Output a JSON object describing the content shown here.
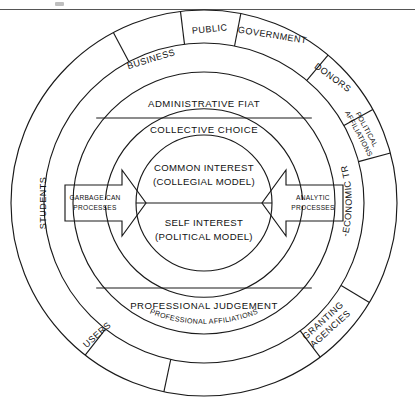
{
  "figure": {
    "background_color": "#ffffff",
    "line_color": "#1a1a1a",
    "top_rule": true
  },
  "geometry": {
    "center_x": 204,
    "center_y": 203,
    "r_outer": 193,
    "r_outer_inner": 160,
    "r_band": 131,
    "r_core": 68
  },
  "outer_ring": {
    "name": "stakeholder-ring",
    "segments": [
      {
        "id": "students",
        "label": "STUDENTS",
        "orientation": "radial"
      },
      {
        "id": "business",
        "label": "BUSINESS",
        "orientation": "radial"
      },
      {
        "id": "public",
        "label": "PUBLIC",
        "orientation": "radial"
      },
      {
        "id": "government",
        "label": "GOVERNMENT",
        "orientation": "radial"
      },
      {
        "id": "donors",
        "label": "DONORS",
        "orientation": "radial"
      },
      {
        "id": "political-affiliations",
        "label": "POLITICAL AFFILIATIONS",
        "label_line1": "POLITICAL",
        "label_line2": "AFFILIATIONS",
        "orientation": "radial"
      },
      {
        "id": "socio-economic-trends",
        "label": "SOCIO-ECONOMIC TRENDS",
        "orientation": "curved"
      },
      {
        "id": "granting-agencies",
        "label": "GRANTING AGENCIES",
        "label_line1": "GRANTING",
        "label_line2": "AGENCIES",
        "orientation": "radial"
      },
      {
        "id": "professional-affiliations",
        "label": "PROFESSIONAL AFFILIATIONS",
        "orientation": "curved"
      },
      {
        "id": "users",
        "label": "USERS",
        "orientation": "radial"
      }
    ]
  },
  "bands": {
    "top": {
      "id": "administrative-fiat",
      "label": "ADMINISTRATIVE FIAT"
    },
    "upper_mid": {
      "id": "collective-choice",
      "label": "COLLECTIVE CHOICE"
    },
    "bottom": {
      "id": "professional-judgement",
      "label": "PROFESSIONAL JUDGEMENT"
    }
  },
  "core": {
    "top": {
      "id": "common-interest",
      "line1": "COMMON INTEREST",
      "line2": "(COLLEGIAL MODEL)"
    },
    "bottom": {
      "id": "self-interest",
      "line1": "SELF INTEREST",
      "line2": "(POLITICAL MODEL)"
    }
  },
  "arrows": {
    "left": {
      "id": "garbage-can-processes",
      "line1": "GARBAGE CAN",
      "line2": "PROCESSES",
      "direction": "right"
    },
    "right": {
      "id": "analytic-processes",
      "line1": "ANALYTIC",
      "line2": "PROCESSES",
      "direction": "left"
    }
  }
}
